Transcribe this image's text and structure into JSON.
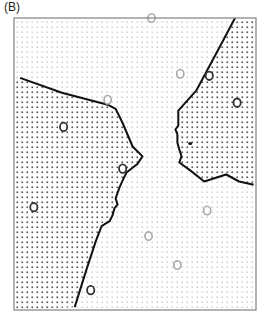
{
  "panel": {
    "label": "(B)"
  },
  "legend_semantics": {
    "dark_dots": "region assigned to dark-circle class",
    "light_dots": "region assigned to gray-circle class"
  },
  "colors": {
    "frame": "#8a8a8a",
    "boundary": "#111111",
    "dark_dot": "#555555",
    "light_dot": "#c4c4c4",
    "dark_circle": "#333333",
    "gray_circle": "#a8a8a8"
  },
  "points": {
    "dark_circles": [
      {
        "x": 0.205,
        "y": 0.373
      },
      {
        "x": 0.082,
        "y": 0.648
      },
      {
        "x": 0.449,
        "y": 0.516
      },
      {
        "x": 0.807,
        "y": 0.198
      },
      {
        "x": 0.922,
        "y": 0.29
      },
      {
        "x": 0.317,
        "y": 0.932
      }
    ],
    "gray_circles": [
      {
        "x": 0.568,
        "y": 0.0
      },
      {
        "x": 0.687,
        "y": 0.191
      },
      {
        "x": 0.387,
        "y": 0.28
      },
      {
        "x": 0.798,
        "y": 0.659
      },
      {
        "x": 0.556,
        "y": 0.747
      },
      {
        "x": 0.675,
        "y": 0.846
      }
    ],
    "marks": [
      {
        "x": 0.728,
        "y": 0.43
      }
    ]
  },
  "boundaries": {
    "left": [
      [
        0.025,
        0.205
      ],
      [
        0.198,
        0.256
      ],
      [
        0.387,
        0.297
      ],
      [
        0.42,
        0.311
      ],
      [
        0.448,
        0.358
      ],
      [
        0.49,
        0.44
      ],
      [
        0.531,
        0.474
      ],
      [
        0.51,
        0.5
      ],
      [
        0.465,
        0.529
      ],
      [
        0.449,
        0.556
      ],
      [
        0.436,
        0.58
      ],
      [
        0.42,
        0.618
      ],
      [
        0.428,
        0.638
      ],
      [
        0.415,
        0.652
      ],
      [
        0.407,
        0.676
      ],
      [
        0.395,
        0.696
      ],
      [
        0.362,
        0.713
      ],
      [
        0.338,
        0.764
      ],
      [
        0.3,
        0.86
      ],
      [
        0.251,
        0.99
      ]
    ],
    "right": [
      [
        0.926,
        -0.02
      ],
      [
        0.852,
        0.096
      ],
      [
        0.753,
        0.249
      ],
      [
        0.679,
        0.317
      ],
      [
        0.679,
        0.369
      ],
      [
        0.667,
        0.382
      ],
      [
        0.675,
        0.399
      ],
      [
        0.675,
        0.427
      ],
      [
        0.683,
        0.45
      ],
      [
        0.692,
        0.474
      ],
      [
        0.683,
        0.495
      ],
      [
        0.728,
        0.522
      ],
      [
        0.786,
        0.56
      ],
      [
        0.877,
        0.536
      ],
      [
        0.93,
        0.56
      ],
      [
        0.99,
        0.571
      ]
    ]
  }
}
